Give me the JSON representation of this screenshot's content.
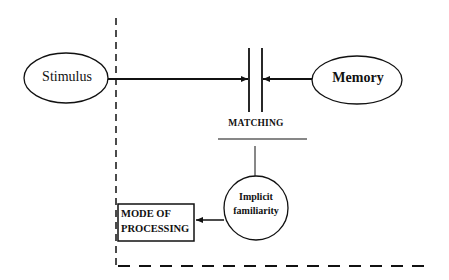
{
  "diagram": {
    "nodes": {
      "stimulus": {
        "label": "Stimulus",
        "shape": "ellipse"
      },
      "memory": {
        "label": "Memory",
        "shape": "ellipse"
      },
      "matching": {
        "label": "MATCHING",
        "shape": "parallel-bars"
      },
      "implicit_familiarity": {
        "line1": "Implicit",
        "line2": "familiarity",
        "shape": "circle"
      },
      "mode_of_processing": {
        "line1": "MODE OF",
        "line2": "PROCESSING",
        "shape": "rectangle"
      }
    },
    "edges": [
      {
        "from": "Stimulus",
        "to": "MATCHING",
        "type": "arrow"
      },
      {
        "from": "Memory",
        "to": "MATCHING",
        "type": "arrow"
      },
      {
        "from": "MATCHING",
        "to": "Implicit familiarity",
        "type": "line"
      },
      {
        "from": "Implicit familiarity",
        "to": "MODE OF PROCESSING",
        "type": "arrow"
      }
    ],
    "boundary": {
      "style": "dashed",
      "sides": [
        "left",
        "bottom"
      ]
    },
    "colors": {
      "stroke": "#111111",
      "background": "#ffffff"
    }
  }
}
